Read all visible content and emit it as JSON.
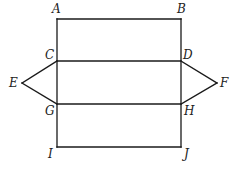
{
  "diagram": {
    "points": {
      "A": {
        "label": "A",
        "x": 57,
        "y": 19
      },
      "B": {
        "label": "B",
        "x": 181,
        "y": 19
      },
      "C": {
        "label": "C",
        "x": 57,
        "y": 61
      },
      "D": {
        "label": "D",
        "x": 181,
        "y": 61
      },
      "E": {
        "label": "E",
        "x": 22,
        "y": 83
      },
      "F": {
        "label": "F",
        "x": 217,
        "y": 83
      },
      "G": {
        "label": "G",
        "x": 57,
        "y": 104
      },
      "H": {
        "label": "H",
        "x": 181,
        "y": 104
      },
      "I": {
        "label": "I",
        "x": 57,
        "y": 147
      },
      "J": {
        "label": "J",
        "x": 181,
        "y": 147
      }
    },
    "segments": [
      [
        "A",
        "B"
      ],
      [
        "A",
        "I"
      ],
      [
        "B",
        "J"
      ],
      [
        "C",
        "D"
      ],
      [
        "G",
        "H"
      ],
      [
        "I",
        "J"
      ],
      [
        "E",
        "C"
      ],
      [
        "E",
        "G"
      ],
      [
        "D",
        "F"
      ],
      [
        "H",
        "F"
      ]
    ],
    "stroke_color": "#1a1a1a"
  }
}
